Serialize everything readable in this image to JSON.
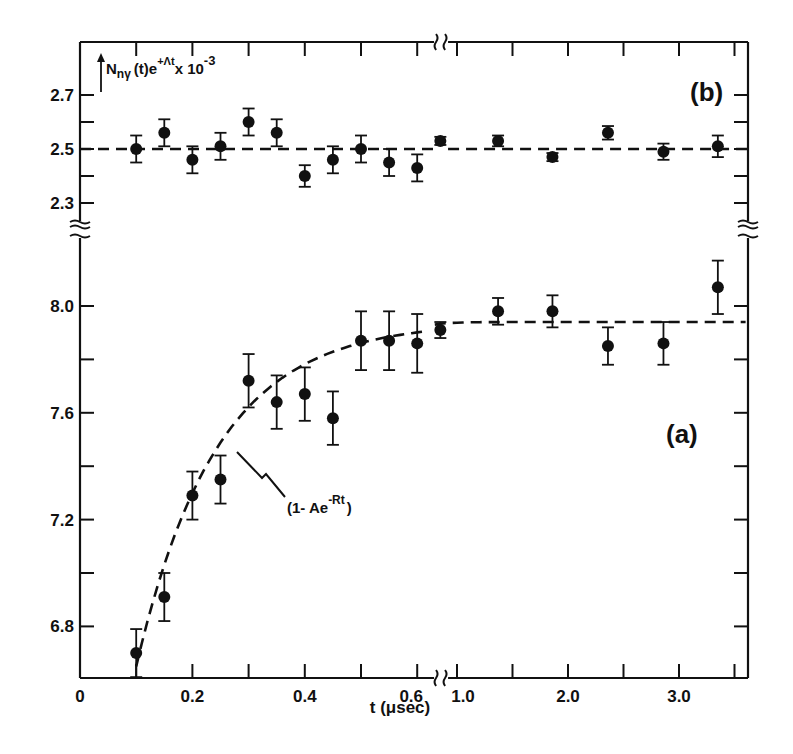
{
  "chart_data": [
    {
      "panel": "(b)",
      "type": "scatter",
      "title": "",
      "ylabel": "N_nγ(t) e^{+Λt} × 10^-3",
      "xlabel": "t (μsec)",
      "ylim": [
        2.2,
        2.8
      ],
      "yticks": [
        2.3,
        2.5,
        2.7
      ],
      "yticks_minor": [
        2.4,
        2.6
      ],
      "fit": {
        "type": "constant",
        "value": 2.5,
        "style": "dashed"
      },
      "series": [
        {
          "name": "data",
          "x": [
            0.1,
            0.15,
            0.2,
            0.25,
            0.3,
            0.35,
            0.4,
            0.45,
            0.5,
            0.55,
            0.6,
            0.85,
            1.37,
            1.86,
            2.36,
            2.86,
            3.35
          ],
          "y": [
            2.5,
            2.56,
            2.46,
            2.51,
            2.6,
            2.56,
            2.4,
            2.46,
            2.5,
            2.45,
            2.43,
            2.53,
            2.53,
            2.47,
            2.56,
            2.49,
            2.51
          ],
          "yerr": [
            0.05,
            0.05,
            0.05,
            0.05,
            0.05,
            0.05,
            0.04,
            0.05,
            0.05,
            0.05,
            0.05,
            0.015,
            0.02,
            0.015,
            0.025,
            0.03,
            0.04
          ]
        }
      ]
    },
    {
      "panel": "(a)",
      "type": "scatter",
      "title": "",
      "ylabel": "N_nγ(t) e^{+Λt} × 10^-3",
      "xlabel": "t (μsec)",
      "ylim": [
        6.6,
        8.2
      ],
      "yticks": [
        6.8,
        7.2,
        7.6,
        8.0
      ],
      "yticks_minor": [
        7.0,
        7.4,
        7.8
      ],
      "fit": {
        "type": "1 - A exp(-R t)",
        "label": "(1- Ae^{-Rt})",
        "asymptote": 7.94,
        "style": "dashed"
      },
      "series": [
        {
          "name": "data",
          "x": [
            0.1,
            0.15,
            0.2,
            0.25,
            0.3,
            0.35,
            0.4,
            0.45,
            0.5,
            0.55,
            0.6,
            0.85,
            1.37,
            1.86,
            2.36,
            2.86,
            3.35
          ],
          "y": [
            6.7,
            6.91,
            7.29,
            7.35,
            7.72,
            7.64,
            7.67,
            7.58,
            7.87,
            7.87,
            7.86,
            7.91,
            7.98,
            7.98,
            7.85,
            7.86,
            8.07
          ],
          "yerr": [
            0.09,
            0.09,
            0.09,
            0.09,
            0.1,
            0.1,
            0.1,
            0.1,
            0.11,
            0.11,
            0.11,
            0.03,
            0.05,
            0.06,
            0.07,
            0.08,
            0.1
          ]
        }
      ]
    }
  ],
  "x_axis": {
    "label": "t (μsec)",
    "segment1": {
      "range": [
        0,
        0.6
      ],
      "tick_labels": [
        "0",
        "0.2",
        "0.4",
        "0.6"
      ],
      "minor_step": 0.1
    },
    "axis_break_after": 0.6,
    "segment2": {
      "range": [
        0.8,
        3.5
      ],
      "tick_labels": [
        "1.0",
        "2.0",
        "3.0"
      ],
      "minor_step": 0.5
    }
  },
  "labels": {
    "panel_b": "(b)",
    "panel_a": "(a)",
    "y_axis_main": "N",
    "y_axis_sub": "nγ",
    "y_axis_mid": "(t)e",
    "y_axis_sup": "+Λt",
    "y_axis_tail": "x 10",
    "y_axis_exp": "-3",
    "fit_annotation": "(1- Ae",
    "fit_annotation_sup": "-Rt",
    "fit_annotation_close": ")",
    "x_axis_label": "t (μsec)"
  }
}
